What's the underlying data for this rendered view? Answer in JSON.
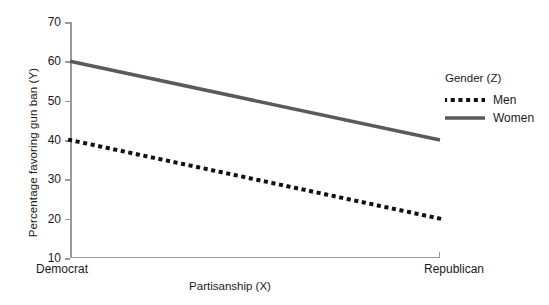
{
  "chart_data": {
    "type": "line",
    "title": "",
    "xlabel": "Partisanship (X)",
    "ylabel": "Percentage favoring gun ban (Y)",
    "categories": [
      "Democrat",
      "Republican"
    ],
    "x": [
      0,
      1
    ],
    "ylim": [
      10,
      70
    ],
    "yticks": [
      10,
      20,
      30,
      40,
      50,
      60,
      70
    ],
    "ytick_labels": [
      "10",
      "20",
      "30",
      "40",
      "50",
      "60",
      "70"
    ],
    "grid": false,
    "legend_position": "right-outside",
    "legend_title": "Gender (Z)",
    "series": [
      {
        "name": "Men",
        "values": [
          40,
          20
        ],
        "style": "dotted",
        "color": "#111111",
        "width": 4
      },
      {
        "name": "Women",
        "values": [
          60,
          40
        ],
        "style": "solid",
        "color": "#5a5a5a",
        "width": 3.5
      }
    ]
  },
  "axes": {
    "axis_color": "#9a9a9a"
  }
}
